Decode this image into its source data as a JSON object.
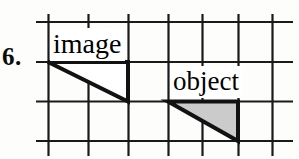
{
  "figure": {
    "item_number": "6.",
    "background_color": "#fdfdfc",
    "line_color": "#1a1a1a",
    "grid": {
      "x_lines": [
        48,
        88,
        128,
        168,
        198,
        238,
        272
      ],
      "y_lines": [
        22,
        62,
        101,
        141
      ],
      "h_extent": [
        36,
        293
      ],
      "v_extent": [
        14,
        156
      ],
      "stroke_width": 2.2,
      "grid_on": true
    },
    "shapes": [
      {
        "name": "image-triangle",
        "label": "image",
        "fill": "#ffffff",
        "stroke": "#121212",
        "stroke_width": 4,
        "points": "48,62 128,62 128,101",
        "right_angle_at": "bottom-right"
      },
      {
        "name": "object-triangle",
        "label": "object",
        "fill": "#cbcbcb",
        "stroke": "#121212",
        "stroke_width": 4,
        "points": "168,101 238,101 238,141",
        "right_angle_at": "bottom-right"
      }
    ],
    "labels": [
      {
        "name": "image-label",
        "text": "image"
      },
      {
        "name": "object-label",
        "text": "object"
      }
    ]
  }
}
